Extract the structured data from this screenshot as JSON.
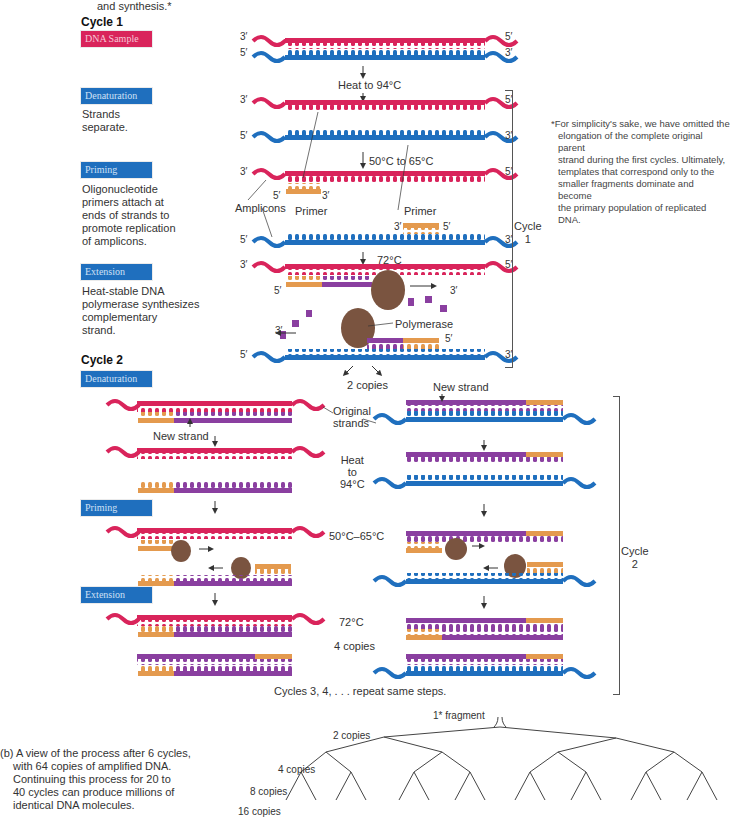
{
  "header": {
    "top_caption": "and synthesis.*",
    "cycle1_title": "Cycle 1",
    "cycle2_title": "Cycle 2"
  },
  "steps": {
    "dna_sample": "DNA Sample",
    "denaturation": "Denaturation",
    "denaturation_desc": [
      "Strands",
      "separate."
    ],
    "priming": "Priming",
    "priming_desc": [
      "Oligonucleotide",
      "primers attach at",
      "ends of strands to",
      "promote replication",
      "of amplicons."
    ],
    "extension": "Extension",
    "extension_desc": [
      "Heat-stable DNA",
      "polymerase synthesizes",
      "complementary",
      "strand."
    ]
  },
  "cycle1": {
    "end_labels": {
      "three_prime": "3′",
      "five_prime": "5′"
    },
    "heat_label": "Heat to 94°C",
    "anneal_label": "50°C to 65°C",
    "amplicons_label": "Amplicons",
    "primer_label": "Primer",
    "extend_label": "72°C",
    "polymerase_label": "Polymerase",
    "copies_label": "2 copies",
    "bracket_label": [
      "Cycle",
      "1"
    ]
  },
  "footnote": {
    "text": [
      "*For simplicity's sake, we have omitted the",
      "elongation of the complete original parent",
      "strand during the first cycles. Ultimately,",
      "templates that correspond only to the",
      "smaller fragments dominate and become",
      "the primary population of replicated DNA."
    ]
  },
  "cycle2": {
    "new_strand_label": "New strand",
    "original_strands_label": [
      "Original",
      "strands"
    ],
    "heat_label": [
      "Heat",
      "to",
      "94°C"
    ],
    "anneal_label": "50°C–65°C",
    "extend_label": "72°C",
    "copies_label": "4 copies",
    "repeat_label": "Cycles 3, 4, . . . repeat same steps.",
    "bracket_label": [
      "Cycle",
      "2"
    ]
  },
  "panel_b": {
    "caption": [
      "(b) A view of the process after 6 cycles,",
      "with 64 copies of amplified DNA.",
      "Continuing this process for 20 to",
      "40 cycles can produce millions of",
      "identical DNA molecules."
    ],
    "tree_labels": [
      "1* fragment",
      "2 copies",
      "4 copies",
      "8 copies",
      "16 copies"
    ]
  },
  "colors": {
    "original_strand_top": "#d9245b",
    "original_strand_bottom": "#1f6fbe",
    "new_strand": "#8a3fa0",
    "primer": "#e49a4e",
    "polymerase": "#7a5440",
    "step_blue": "#1f6fbe",
    "step_pink": "#d9245b"
  }
}
